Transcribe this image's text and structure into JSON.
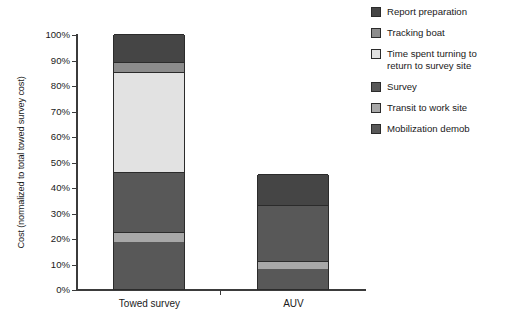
{
  "chart_data": {
    "type": "bar",
    "subtype": "stacked-vertical",
    "title": "",
    "xlabel": "",
    "ylabel": "Cost (normalized to total towed survey cost)",
    "categories": [
      "Towed survey",
      "AUV"
    ],
    "ylim": [
      0,
      100
    ],
    "ytick_labels": [
      "100%",
      "90%",
      "80%",
      "70%",
      "60%",
      "50%",
      "40%",
      "30%",
      "20%",
      "10%",
      "0%"
    ],
    "ytick_values": [
      100,
      90,
      80,
      70,
      60,
      50,
      40,
      30,
      20,
      10,
      0
    ],
    "yunit": "%",
    "grid": false,
    "legend_position": "right",
    "stack_order_bottom_to_top": [
      "Mobilization demob",
      "Transit to work site",
      "Survey",
      "Time spent turning to return to survey site",
      "Tracking boat",
      "Report preparation"
    ],
    "series": [
      {
        "name": "Mobilization demob",
        "color": "#585858",
        "values": [
          18.5,
          8.0
        ]
      },
      {
        "name": "Transit to work site",
        "color": "#a8a8a8",
        "values": [
          4.0,
          3.0
        ]
      },
      {
        "name": "Survey",
        "color": "#585858",
        "values": [
          23.5,
          22.0
        ]
      },
      {
        "name": "Time spent turning to return to survey site",
        "color": "#e2e2e2",
        "values": [
          39.0,
          0.0
        ]
      },
      {
        "name": "Tracking boat",
        "color": "#8c8c8c",
        "values": [
          4.0,
          0.0
        ]
      },
      {
        "name": "Report preparation",
        "color": "#454545",
        "values": [
          11.0,
          12.0
        ]
      }
    ],
    "totals": [
      100.0,
      45.0
    ],
    "annotations": []
  },
  "legend": {
    "items": [
      {
        "label": "Report preparation",
        "color": "#454545"
      },
      {
        "label": "Tracking boat",
        "color": "#8c8c8c"
      },
      {
        "label": "Time spent turning to return to survey site",
        "color": "#e2e2e2"
      },
      {
        "label": "Survey",
        "color": "#585858"
      },
      {
        "label": "Transit to work site",
        "color": "#a8a8a8"
      },
      {
        "label": "Mobilization demob",
        "color": "#585858"
      }
    ]
  }
}
